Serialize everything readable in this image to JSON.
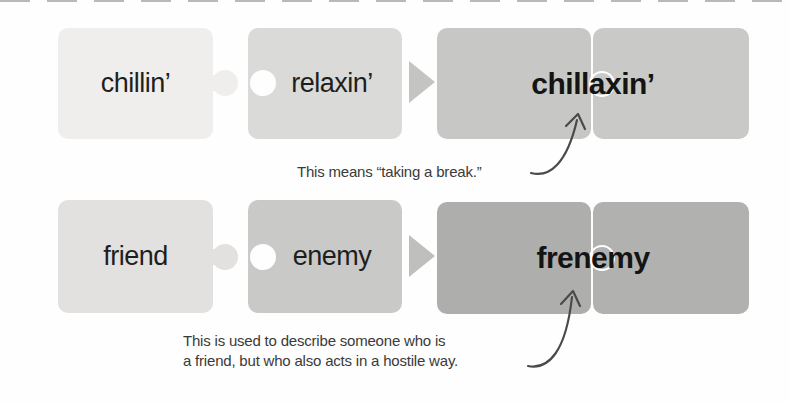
{
  "diagram": {
    "rows": [
      {
        "part1": "chillin’",
        "part2": "relaxin’",
        "blend": "chillaxin’",
        "annotation": [
          "This means “taking a break.”"
        ]
      },
      {
        "part1": "friend",
        "part2": "enemy",
        "blend": "frenemy",
        "annotation": [
          "This is used to describe someone who is",
          "a friend, but who also acts in a hostile way."
        ]
      }
    ],
    "colors": {
      "row1_part1_piece": "#efeeec",
      "row1_part2_piece": "#dadad8",
      "row1_blend_piece": "#c7c7c5",
      "row2_part1_piece": "#e2e1df",
      "row2_part2_piece": "#c9c9c7",
      "row2_blend_piece": "#aeaeac",
      "triangle_arrow": "#c4c4c2",
      "word_text": "#1e1e1e",
      "annotation_text": "#3a3a3a",
      "curved_arrow": "#4a4a4a"
    }
  }
}
